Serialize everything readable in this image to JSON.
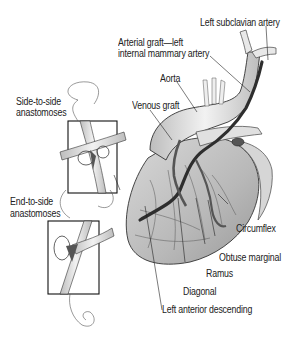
{
  "figure": {
    "labels": {
      "left_subclavian": "Left subclavian artery",
      "arterial_graft_line1": "Arterial graft—left",
      "arterial_graft_line2": "internal mammary artery",
      "aorta": "Aorta",
      "venous_graft": "Venous graft",
      "side_to_side_line1": "Side-to-side",
      "side_to_side_line2": "anastomoses",
      "end_to_side_line1": "End-to-side",
      "end_to_side_line2": "anastomoses",
      "circumflex": "Circumflex",
      "obtuse_marginal": "Obtuse marginal",
      "ramus": "Ramus",
      "diagonal": "Diagonal",
      "left_anterior_descending": "Left anterior descending"
    },
    "colors": {
      "outline": "#222222",
      "heart_fill": "#c9c9c9",
      "vessel_fill": "#e6e6e6",
      "graft": "#3a3a3a",
      "background": "#ffffff"
    }
  }
}
